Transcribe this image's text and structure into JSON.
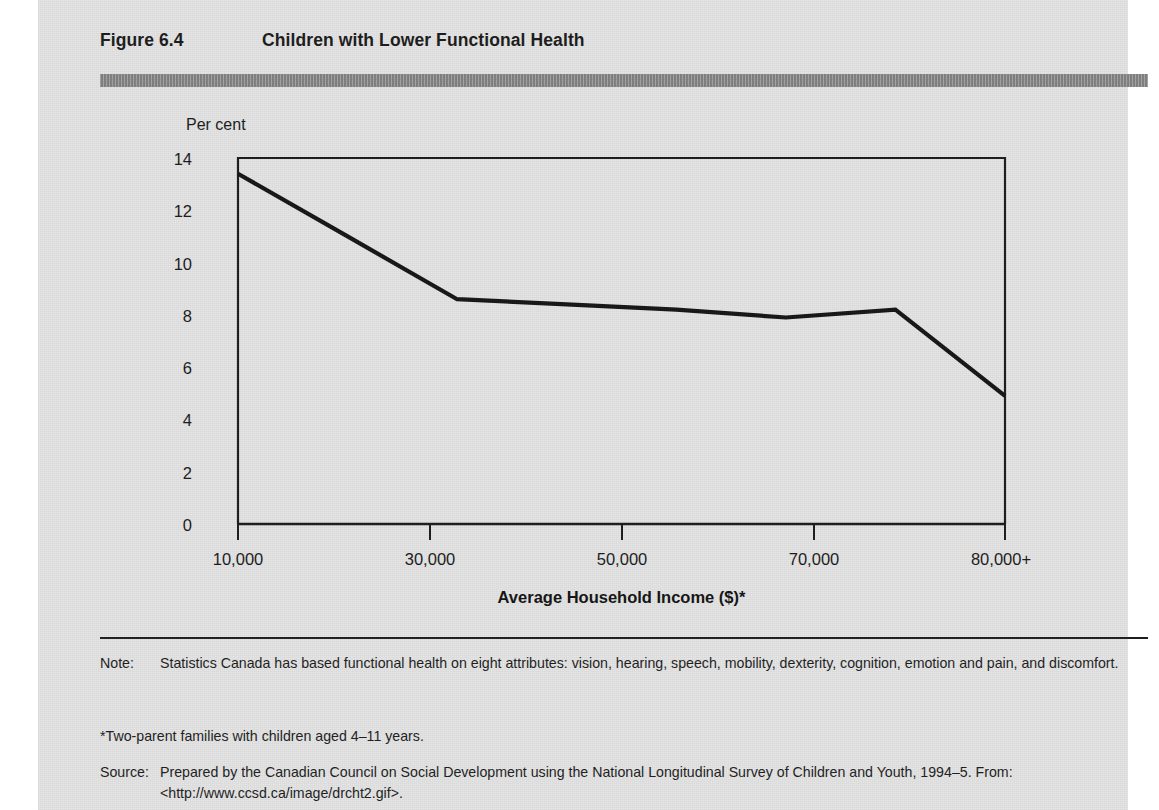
{
  "figure": {
    "label": "Figure 6.4",
    "title": "Children with Lower Functional Health",
    "bar_color": "#8d8d8d",
    "panel_color": "#e3e3e3"
  },
  "chart_data": {
    "type": "line",
    "title": "Children with Lower Functional Health",
    "xlabel": "Average Household Income ($)*",
    "ylabel": "Per cent",
    "categories": [
      "10,000",
      "20,000",
      "30,000",
      "40,000",
      "50,000",
      "60,000",
      "70,000",
      "80,000+"
    ],
    "x": [
      10000,
      20000,
      30000,
      40000,
      50000,
      60000,
      70000,
      80000
    ],
    "values": [
      13.4,
      11.0,
      8.6,
      8.4,
      8.2,
      7.9,
      8.2,
      4.9
    ],
    "series": [
      {
        "name": "Children with lower functional health",
        "values": [
          13.4,
          11.0,
          8.6,
          8.4,
          8.2,
          7.9,
          8.2,
          4.9
        ]
      }
    ],
    "xticks": [
      "10,000",
      "30,000",
      "50,000",
      "70,000",
      "80,000+"
    ],
    "xtick_values": [
      10000,
      30000,
      50000,
      70000,
      80000
    ],
    "yticks": [
      0,
      2,
      4,
      6,
      8,
      10,
      12,
      14
    ],
    "ylim": [
      0,
      14
    ],
    "xlim": [
      10000,
      80000
    ],
    "grid": false,
    "legend": "none",
    "line_color": "#141414"
  },
  "footer": {
    "note_key": "Note:",
    "note_text": "Statistics Canada has based functional health on eight attributes: vision, hearing, speech, mobility, dexterity, cognition, emotion and pain, and discomfort.",
    "footnote": "*Two-parent families with children aged 4–11 years.",
    "source_key": "Source:",
    "source_line1": "Prepared by the Canadian Council on Social Development using the National Longitudinal Survey of Children and",
    "source_line2": "Youth, 1994–5. From: <http://www.ccsd.ca/image/drcht2.gif>."
  }
}
